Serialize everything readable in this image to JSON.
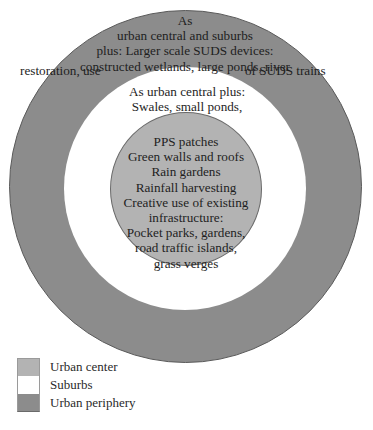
{
  "diagram": {
    "type": "concentric-zones",
    "colors": {
      "urban_center": "#b3b3b3",
      "suburbs": "#ffffff",
      "urban_periphery": "#8c8c8c"
    },
    "zones": {
      "outer": {
        "name": "Urban periphery",
        "lines": [
          "As",
          "urban central and suburbs",
          "plus: Larger scale SUDS devices:",
          "constructed wetlands, large ponds, river"
        ],
        "last_line_left": "restoration, use",
        "last_line_right": "of SUDS trains"
      },
      "middle": {
        "name": "Suburbs",
        "lines": [
          "As urban central plus:",
          "Swales, small ponds,"
        ]
      },
      "inner": {
        "name": "Urban center",
        "lines": [
          "PPS patches",
          "Green walls and roofs",
          "Rain gardens",
          "Rainfall harvesting",
          "Creative use of existing",
          "infrastructure:",
          "Pocket parks, gardens,",
          "road traffic islands,",
          "grass verges"
        ]
      }
    },
    "legend": [
      {
        "label": "Urban center",
        "color": "#b3b3b3"
      },
      {
        "label": "Suburbs",
        "color": "#ffffff"
      },
      {
        "label": "Urban periphery",
        "color": "#8c8c8c"
      }
    ]
  }
}
